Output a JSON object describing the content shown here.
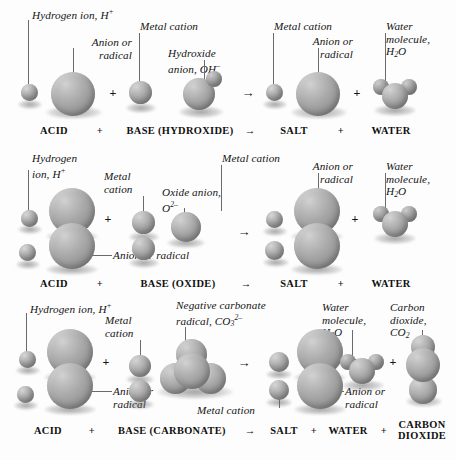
{
  "figure": {
    "colors": {
      "background": "#fdfdfd",
      "sphere_light": "#d2d2d2",
      "sphere_mid": "#a0a0a0",
      "sphere_dark": "#767676",
      "leader_line": "#6b6b6b",
      "text": "#141414"
    }
  },
  "rows": [
    {
      "id": "row-hydroxide",
      "caption": {
        "acid": "ACID",
        "plus1": "+",
        "base": "BASE (HYDROXIDE)",
        "arrow": "→",
        "salt": "SALT",
        "plus2": "+",
        "water": "WATER"
      },
      "operators": {
        "plus1": "+",
        "arrow": "→",
        "plus2": "+"
      },
      "labels": [
        {
          "id": "acid-hydrogen",
          "lines": [
            "Hydrogen ion, H⁺"
          ]
        },
        {
          "id": "acid-anion",
          "lines": [
            "Anion or",
            "radical"
          ]
        },
        {
          "id": "base-metal-cation",
          "lines": [
            "Metal cation"
          ]
        },
        {
          "id": "base-hydroxide",
          "lines": [
            "Hydroxide",
            "anion, OH⁻"
          ]
        },
        {
          "id": "salt-metal-cation",
          "lines": [
            "Metal cation"
          ]
        },
        {
          "id": "salt-anion",
          "lines": [
            "Anion or",
            "radical"
          ]
        },
        {
          "id": "water-molecule",
          "lines": [
            "Water",
            "molecule,",
            "H₂O"
          ]
        }
      ]
    },
    {
      "id": "row-oxide",
      "caption": {
        "acid": "ACID",
        "plus1": "+",
        "base": "BASE (OXIDE)",
        "arrow": "→",
        "salt": "SALT",
        "plus2": "+",
        "water": "WATER"
      },
      "operators": {
        "plus1": "+",
        "arrow": "→",
        "plus2": "+"
      },
      "labels": [
        {
          "id": "acid-hydrogen",
          "lines": [
            "Hydrogen",
            "ion, H⁺"
          ]
        },
        {
          "id": "acid-anion",
          "lines": [
            "Anion or radical"
          ]
        },
        {
          "id": "base-metal-cation",
          "lines": [
            "Metal",
            "cation"
          ]
        },
        {
          "id": "base-oxide",
          "lines": [
            "Oxide anion,",
            "O²⁻"
          ]
        },
        {
          "id": "salt-metal-cation",
          "lines": [
            "Metal cation"
          ]
        },
        {
          "id": "salt-anion",
          "lines": [
            "Anion or",
            "radical"
          ]
        },
        {
          "id": "water-molecule",
          "lines": [
            "Water",
            "molecule,",
            "H₂O"
          ]
        }
      ]
    },
    {
      "id": "row-carbonate",
      "caption": {
        "acid": "ACID",
        "plus1": "+",
        "base": "BASE (CARBONATE)",
        "arrow": "→",
        "salt": "SALT",
        "plus2": "+",
        "water": "WATER",
        "plus3": "+",
        "carbon_dioxide": "CARBON DIOXIDE"
      },
      "operators": {
        "plus1": "+",
        "arrow": "→",
        "plus2": "+",
        "plus3": "+"
      },
      "labels": [
        {
          "id": "acid-hydrogen",
          "lines": [
            "Hydrogen ion, H⁺"
          ]
        },
        {
          "id": "acid-anion",
          "lines": [
            "Anion or",
            "radical"
          ]
        },
        {
          "id": "base-metal-cation",
          "lines": [
            "Metal",
            "cation"
          ]
        },
        {
          "id": "base-carbonate",
          "lines": [
            "Negative carbonate",
            "radical, CO₃²⁻"
          ]
        },
        {
          "id": "salt-metal-cation",
          "lines": [
            "Metal cation"
          ]
        },
        {
          "id": "salt-anion",
          "lines": [
            "Anion or",
            "radical"
          ]
        },
        {
          "id": "water-molecule",
          "lines": [
            "Water",
            "molecule,",
            "H₂O"
          ]
        },
        {
          "id": "carbon-dioxide",
          "lines": [
            "Carbon",
            "dioxide,",
            "CO₂"
          ]
        }
      ]
    }
  ],
  "label_text": {
    "r1": {
      "acid_hydrogen": "Hydrogen ion, H",
      "acid_hydrogen_sup": "+",
      "acid_anion_l1": "Anion or",
      "acid_anion_l2": "radical",
      "base_metal": "Metal cation",
      "base_hydroxide_l1": "Hydroxide",
      "base_hydroxide_l2": "anion, OH",
      "base_hydroxide_sup": "–",
      "salt_metal": "Metal cation",
      "salt_anion_l1": "Anion or",
      "salt_anion_l2": "radical",
      "water_l1": "Water",
      "water_l2": "molecule,",
      "water_l3_pre": "H",
      "water_l3_sub": "2",
      "water_l3_post": "O",
      "cap_acid": "ACID",
      "cap_plus1": "+",
      "cap_base": "BASE (HYDROXIDE)",
      "cap_arrow": "→",
      "cap_salt": "SALT",
      "cap_plus2": "+",
      "cap_water": "WATER"
    },
    "r2": {
      "acid_hydrogen_l1": "Hydrogen",
      "acid_hydrogen_l2": "ion, H",
      "acid_hydrogen_sup": "+",
      "acid_anion": "Anion or radical",
      "base_metal_l1": "Metal",
      "base_metal_l2": "cation",
      "base_oxide_l1": "Oxide anion,",
      "base_oxide_l2": "O",
      "base_oxide_sup": "2–",
      "salt_metal": "Metal cation",
      "salt_anion_l1": "Anion or",
      "salt_anion_l2": "radical",
      "water_l1": "Water",
      "water_l2": "molecule,",
      "water_l3_pre": "H",
      "water_l3_sub": "2",
      "water_l3_post": "O",
      "cap_acid": "ACID",
      "cap_plus1": "+",
      "cap_base": "BASE (OXIDE)",
      "cap_arrow": "→",
      "cap_salt": "SALT",
      "cap_plus2": "+",
      "cap_water": "WATER"
    },
    "r3": {
      "acid_hydrogen": "Hydrogen ion, H",
      "acid_hydrogen_sup": "+",
      "acid_anion_l1": "Anion or",
      "acid_anion_l2": "radical",
      "base_metal_l1": "Metal",
      "base_metal_l2": "cation",
      "base_carbonate_l1": "Negative carbonate",
      "base_carbonate_l2_pre": "radical, CO",
      "base_carbonate_sub": "3",
      "base_carbonate_sup": "2–",
      "salt_metal": "Metal cation",
      "salt_anion_l1": "Anion or",
      "salt_anion_l2": "radical",
      "water_l1": "Water",
      "water_l2": "molecule,",
      "water_l3_pre": "H",
      "water_l3_sub": "2",
      "water_l3_post": "O",
      "co2_l1": "Carbon",
      "co2_l2": "dioxide,",
      "co2_l3_pre": "CO",
      "co2_l3_sub": "2",
      "cap_acid": "ACID",
      "cap_plus1": "+",
      "cap_base": "BASE (CARBONATE)",
      "cap_arrow": "→",
      "cap_salt": "SALT",
      "cap_plus2": "+",
      "cap_water": "WATER",
      "cap_plus3": "+",
      "cap_co2_l1": "CARBON",
      "cap_co2_l2": "DIOXIDE"
    }
  }
}
